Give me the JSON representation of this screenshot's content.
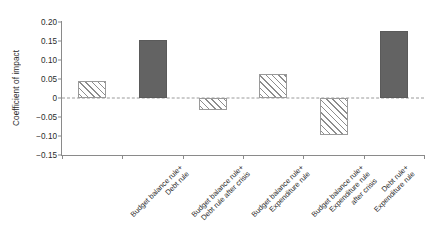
{
  "chart_data": {
    "type": "bar",
    "title": "",
    "subtitle": "",
    "xlabel": "",
    "ylabel": "Coefficient of impact",
    "ylim": [
      -0.15,
      0.2
    ],
    "yticks": [
      "0.20",
      "0.15",
      "0.10",
      "0.05",
      "0",
      "-0.05",
      "-0.10",
      "-0.15"
    ],
    "ytick_values": [
      0.2,
      0.15,
      0.1,
      0.05,
      0,
      -0.05,
      -0.1,
      -0.15
    ],
    "grid": false,
    "legend": false,
    "zero_reference_line": true,
    "categories": [
      "Budget balance rule+ Debt rule",
      "Budget balance rule+ Debt rule after crisis",
      "Budget balance rule+ Expenditure rule",
      "Budget balance rule+ Expenditure rule after crisis",
      "Debt rule+ Expenditure rule",
      "Debt rule+Expenditure rule after crisis"
    ],
    "category_label_lines": [
      [
        "Budget balance rule+",
        "Debt rule"
      ],
      [
        "Budget balance rule+",
        "Debt rule after crisis"
      ],
      [
        "Budget balance rule+",
        "Expenditure rule"
      ],
      [
        "Budget balance rule+",
        "Expenditure rule",
        "after crisis"
      ],
      [
        "Debt rule+",
        "Expenditure rule"
      ],
      [
        "Debt rule+Expenditure",
        "rule after crisis"
      ]
    ],
    "values": [
      0.044,
      0.152,
      -0.031,
      0.064,
      -0.097,
      0.177
    ],
    "bar_styles": [
      "hatched",
      "solid",
      "hatched",
      "hatched",
      "hatched",
      "solid"
    ],
    "colors": {
      "solid_fill": "#636363",
      "hatch_line": "#8d8d8d",
      "hatch_background": "#ffffff",
      "bar_border": "#9a9a9a",
      "axis": "#8a8a8a",
      "zero_line": "#9a9a9a",
      "text": "#2b2b2b",
      "plot_background": "#ffffff"
    }
  }
}
